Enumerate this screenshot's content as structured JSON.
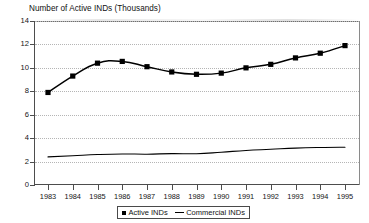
{
  "chart_data": {
    "type": "line",
    "title": "Number of Active INDs (Thousands)",
    "xlabel": "",
    "ylabel": "",
    "ylim": [
      0,
      14
    ],
    "yticks": [
      0,
      2,
      4,
      6,
      8,
      10,
      12,
      14
    ],
    "grid": "horizontal-dotted",
    "legend_position": "bottom-center",
    "categories": [
      "1983",
      "1984",
      "1985",
      "1986",
      "1987",
      "1988",
      "1989",
      "1990",
      "1991",
      "1992",
      "1993",
      "1994",
      "1995"
    ],
    "series": [
      {
        "name": "Active INDs",
        "marker": "filled-square",
        "color": "#000000",
        "values": [
          7.9,
          9.3,
          10.4,
          10.55,
          10.1,
          9.65,
          9.45,
          9.55,
          10.0,
          10.3,
          10.85,
          11.25,
          11.9
        ]
      },
      {
        "name": "Commercial INDs",
        "marker": "none",
        "color": "#000000",
        "values": [
          2.4,
          2.5,
          2.6,
          2.65,
          2.63,
          2.68,
          2.67,
          2.8,
          2.95,
          3.05,
          3.15,
          3.2,
          3.22
        ]
      }
    ]
  },
  "legend": {
    "entries": [
      {
        "label": "Active INDs"
      },
      {
        "label": "Commercial INDs"
      }
    ]
  },
  "ytick_labels": [
    "14",
    "12",
    "10",
    "8",
    "6",
    "4",
    "2",
    "0"
  ]
}
